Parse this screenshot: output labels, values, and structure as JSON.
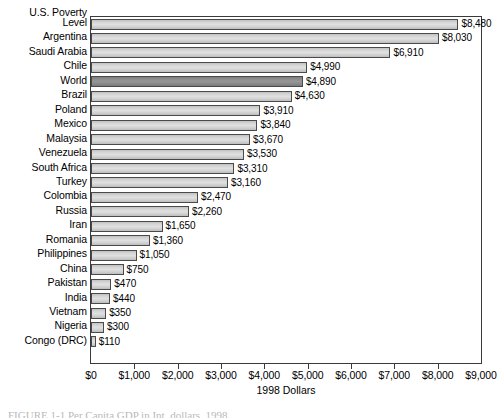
{
  "figure": {
    "caption_sliver": "FIGURE 1-1  Per Capita GDP in Int. dollars, 1998"
  },
  "chart_data": {
    "type": "bar",
    "orientation": "horizontal",
    "title": "",
    "xlabel": "1998 Dollars",
    "ylabel": "",
    "xlim": [
      0,
      9000
    ],
    "xticks": [
      "$0",
      "$1,000",
      "$2,000",
      "$3,000",
      "$4,000",
      "$5,000",
      "$6,000",
      "$7,000",
      "$8,000",
      "$9,000"
    ],
    "xtick_values": [
      0,
      1000,
      2000,
      3000,
      4000,
      5000,
      6000,
      7000,
      8000,
      9000
    ],
    "grid": false,
    "legend": null,
    "highlight_color": "#8e8e8e",
    "bar_color": "#d7d7d7",
    "first_label_prefix": "U.S. Poverty",
    "categories": [
      "Level",
      "Argentina",
      "Saudi Arabia",
      "Chile",
      "World",
      "Brazil",
      "Poland",
      "Mexico",
      "Malaysia",
      "Venezuela",
      "South Africa",
      "Turkey",
      "Colombia",
      "Russia",
      "Iran",
      "Romania",
      "Philippines",
      "China",
      "Pakistan",
      "India",
      "Vietnam",
      "Nigeria",
      "Congo (DRC)"
    ],
    "values": [
      8480,
      8030,
      6910,
      4990,
      4890,
      4630,
      3910,
      3840,
      3670,
      3530,
      3310,
      3160,
      2470,
      2260,
      1650,
      1360,
      1050,
      750,
      470,
      440,
      350,
      300,
      110
    ],
    "value_labels": [
      "$8,480",
      "$8,030",
      "$6,910",
      "$4,990",
      "$4,890",
      "$4,630",
      "$3,910",
      "$3,840",
      "$3,670",
      "$3,530",
      "$3,310",
      "$3,160",
      "$2,470",
      "$2,260",
      "$1,650",
      "$1,360",
      "$1,050",
      "$750",
      "$470",
      "$440",
      "$350",
      "$300",
      "$110"
    ],
    "highlighted": [
      "World"
    ]
  }
}
